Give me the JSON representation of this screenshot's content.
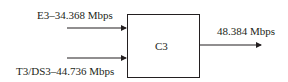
{
  "diagram": {
    "inputs": [
      {
        "label": "E3–34.368 Mbps"
      },
      {
        "label": "T3/DS3–44.736 Mbps"
      }
    ],
    "block": {
      "label": "C3"
    },
    "output": {
      "label": "48.384 Mbps"
    },
    "colors": {
      "stroke": "#231f20",
      "text": "#231f20",
      "background": "#ffffff"
    }
  }
}
